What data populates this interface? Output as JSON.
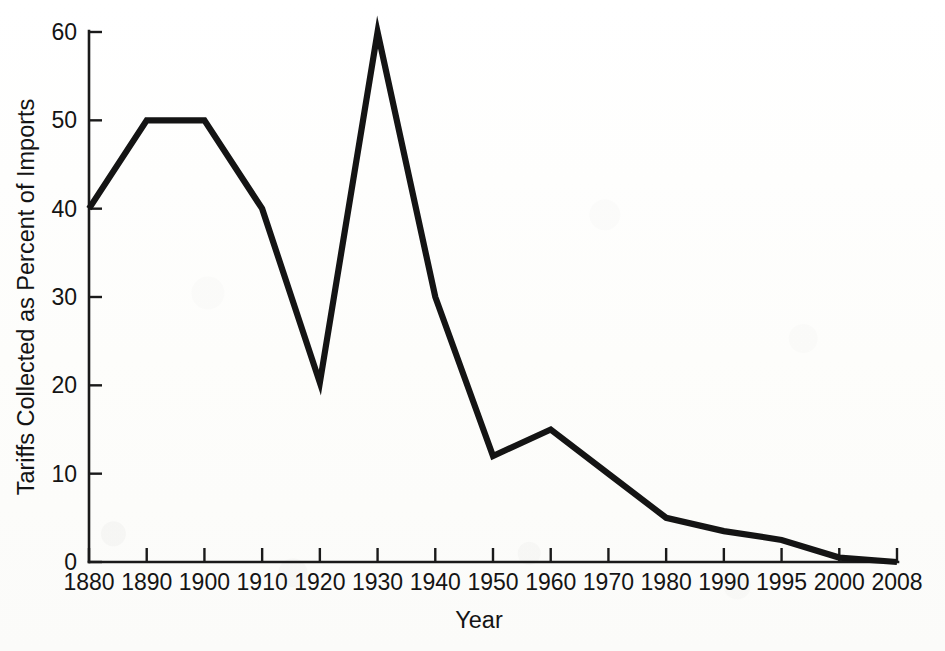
{
  "chart_data": {
    "type": "line",
    "title": "",
    "xlabel": "Year",
    "ylabel": "Tariffs Collected as Percent of Imports",
    "categories": [
      "1880",
      "1890",
      "1900",
      "1910",
      "1920",
      "1930",
      "1940",
      "1950",
      "1960",
      "1970",
      "1980",
      "1990",
      "1995",
      "2000",
      "2008"
    ],
    "values": [
      40,
      50,
      50,
      40,
      20.3,
      60,
      30,
      12,
      15,
      10,
      5,
      3.5,
      2.5,
      0.5,
      0
    ],
    "series": [
      {
        "name": "Tariffs Collected as Percent of Imports",
        "values": [
          40,
          50,
          50,
          40,
          20.3,
          60,
          30,
          12,
          15,
          10,
          5,
          3.5,
          2.5,
          0.5,
          0
        ]
      }
    ],
    "ylim": [
      0,
      60
    ],
    "ytick_labels": [
      "0",
      "10",
      "20",
      "30",
      "40",
      "50",
      "60"
    ],
    "ytick_values": [
      0,
      10,
      20,
      30,
      40,
      50,
      60
    ],
    "grid": false,
    "legend": false,
    "legend_position": "none",
    "line_color": "#141414",
    "background_color": "#fdfdfc",
    "markers": false,
    "tick_direction": "in",
    "x_scale": "categorical"
  },
  "axis": {
    "y_title": "Tariffs Collected as Percent of Imports",
    "x_title": "Year"
  }
}
